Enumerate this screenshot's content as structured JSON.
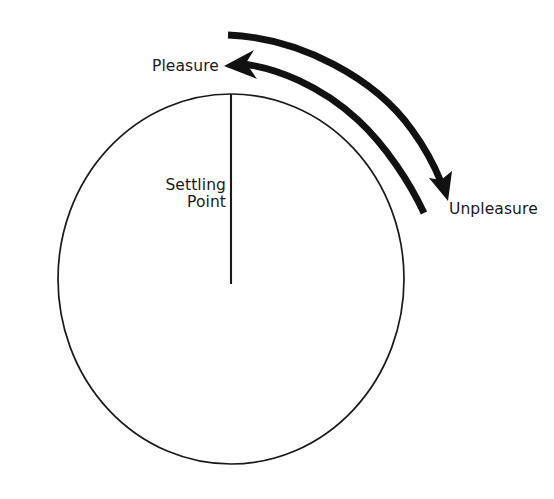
{
  "figure": {
    "type": "concept-diagram",
    "labels": {
      "pleasure": "Pleasure",
      "unpleasure": "Unpleasure",
      "settling_point_line1": "Settling",
      "settling_point_line2": "Point"
    },
    "colors": {
      "background": "#ffffff",
      "stroke": "#111111",
      "circle_outline": "#1a1a1a",
      "text": "#1a1a1a"
    },
    "geometry": {
      "circle": {
        "cx": 231,
        "cy": 279,
        "rx": 173,
        "ry": 185
      },
      "radius_line": {
        "x": 231,
        "y_top": 94,
        "y_bottom": 284
      },
      "arc_stroke_width": 6.5,
      "arrow_pleasure_direction": "left",
      "arrow_unpleasure_direction": "down-right"
    }
  }
}
